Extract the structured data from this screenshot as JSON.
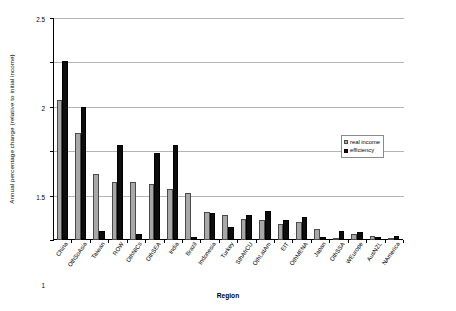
{
  "chart_data": {
    "type": "bar",
    "title": "",
    "xlabel": "Region",
    "ylabel": "Annual percentage change (relative to initial income)",
    "ylim": [
      0,
      2.5
    ],
    "ytick_values": [
      0,
      0.5,
      1,
      1.5,
      2,
      2.5
    ],
    "ytick_labels": [
      "0",
      "0.5",
      "1",
      "1.5",
      "2",
      "2.5"
    ],
    "grid": "horizontal",
    "legend_position": "upper-right-inside",
    "categories": [
      "China",
      "OthSoAsia",
      "Taiwan",
      "ROW",
      "OthNICs",
      "OthSEA",
      "India",
      "Brazil",
      "Indonesia",
      "Turkey",
      "SthAfrCU",
      "OthLatAm",
      "EIT",
      "OthMENA",
      "Japan",
      "OthSSA",
      "WEurope",
      "AusNZL",
      "NAmerica"
    ],
    "series": [
      {
        "name": "real income",
        "color": "#a8a8a8",
        "values": [
          1.58,
          1.2,
          0.74,
          0.65,
          0.65,
          0.63,
          0.57,
          0.53,
          0.31,
          0.28,
          0.24,
          0.23,
          0.18,
          0.2,
          0.12,
          0.02,
          0.07,
          0.05,
          0.01
        ]
      },
      {
        "name": "efficiency",
        "color": "#0d0d0d",
        "values": [
          2.02,
          1.5,
          0.1,
          1.07,
          0.07,
          0.98,
          1.07,
          0.03,
          0.3,
          0.15,
          0.28,
          0.33,
          0.22,
          0.26,
          0.03,
          0.1,
          0.09,
          0.03,
          0.04
        ]
      }
    ]
  },
  "legend": {
    "entries": [
      {
        "label": "real income"
      },
      {
        "label": "efficiency"
      }
    ]
  }
}
